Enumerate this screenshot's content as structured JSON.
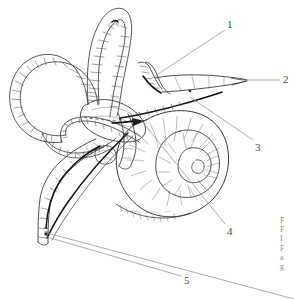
{
  "figure": {
    "background_color": "#ffffff",
    "ink_color": "#3a3a3a",
    "leader_color": "#8c8c8c",
    "width": 294,
    "height": 299,
    "style": "pen-and-ink line drawing, scanned textbook plate"
  },
  "labels": [
    {
      "id": "1",
      "text": "1",
      "x": 227,
      "y": 19,
      "leader_from": [
        225,
        30
      ],
      "leader_to": [
        152,
        78
      ]
    },
    {
      "id": "2",
      "text": "2",
      "x": 283,
      "y": 74,
      "leader_from": [
        280,
        80
      ],
      "leader_to": [
        245,
        80
      ]
    },
    {
      "id": "3",
      "text": "3",
      "x": 255,
      "y": 142,
      "leader_from": [
        253,
        140
      ],
      "leader_to": [
        190,
        97
      ]
    },
    {
      "id": "4",
      "text": "4",
      "x": 227,
      "y": 226,
      "leader_from": [
        225,
        224
      ],
      "leader_to": [
        141,
        120
      ]
    },
    {
      "id": "5",
      "text": "5",
      "x": 184,
      "y": 275,
      "leader_from": [
        181,
        276
      ],
      "leader_to": [
        47,
        237
      ]
    }
  ],
  "extra_leaders": [
    {
      "id": "offpage-leader",
      "from": [
        47,
        233
      ],
      "to": [
        294,
        299
      ]
    }
  ],
  "caption_fragment": {
    "note": "caption text cropped at right edge, only letter stems visible",
    "lines": [
      "F",
      "F",
      "I",
      "F",
      "a",
      "g"
    ]
  },
  "structures": [
    {
      "name": "superior-semicircular-canal"
    },
    {
      "name": "lateral-semicircular-canal"
    },
    {
      "name": "posterior-semicircular-canal"
    },
    {
      "name": "utricle"
    },
    {
      "name": "saccule"
    },
    {
      "name": "cochlea"
    },
    {
      "name": "vestibulocochlear-nerve"
    },
    {
      "name": "endolymphatic-duct"
    },
    {
      "name": "endolymphatic-sac"
    }
  ]
}
